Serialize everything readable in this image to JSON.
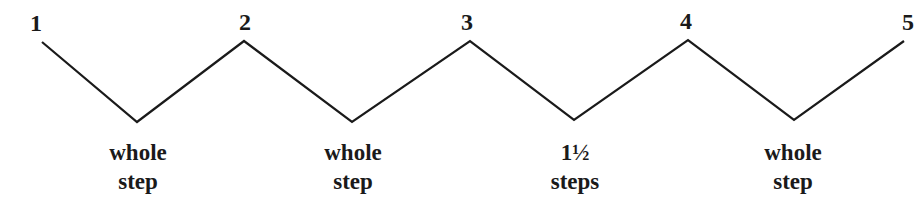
{
  "diagram": {
    "degrees": [
      {
        "label": "1",
        "x": 36,
        "y": 11
      },
      {
        "label": "2",
        "x": 245,
        "y": 10
      },
      {
        "label": "3",
        "x": 467,
        "y": 10
      },
      {
        "label": "4",
        "x": 686,
        "y": 9
      },
      {
        "label": "5",
        "x": 908,
        "y": 10
      }
    ],
    "intervals": [
      {
        "line1": "whole",
        "line2": "step",
        "x": 138
      },
      {
        "line1": "whole",
        "line2": "step",
        "x": 353
      },
      {
        "line1": "1½",
        "line2": "steps",
        "x": 575
      },
      {
        "line1": "whole",
        "line2": "step",
        "x": 793
      }
    ],
    "zigzag_points": "42,42 137,122 244,41 352,122 470,41 574,120 688,40 794,120 904,41",
    "line_color": "#1a1a1a"
  }
}
